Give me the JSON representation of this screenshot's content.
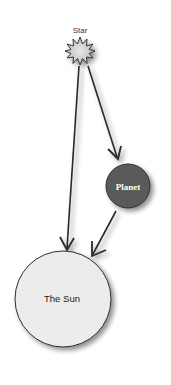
{
  "diagram": {
    "star": {
      "label": "Star"
    },
    "planet": {
      "label": "Planet",
      "fill": "#5a5a5a",
      "text_color": "#ffffff"
    },
    "sun": {
      "label": "The Sun",
      "fill": "#ececec",
      "text_color": "#222222"
    },
    "arrows": [
      {
        "from": "star",
        "to": "sun"
      },
      {
        "from": "star",
        "to": "planet"
      },
      {
        "from": "planet",
        "to": "sun"
      }
    ],
    "stroke_color": "#2a2a2a"
  }
}
